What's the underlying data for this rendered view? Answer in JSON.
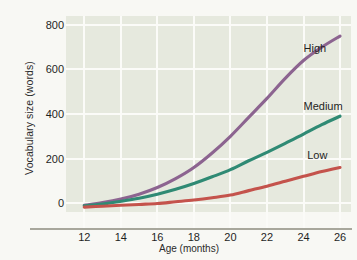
{
  "page": {
    "clipped_header_text": ""
  },
  "chart_data": {
    "type": "line",
    "title": "",
    "xlabel": "Age (months)",
    "ylabel": "Vocabulary size (words)",
    "xlim": [
      11,
      26.6
    ],
    "ylim": [
      -40,
      840
    ],
    "xticks": [
      12,
      14,
      16,
      18,
      20,
      22,
      24,
      26
    ],
    "yticks": [
      0,
      200,
      400,
      600,
      800
    ],
    "grid": true,
    "legend_position": "inline-right",
    "background_color": "#e6e9de",
    "gridline_color": "#fbfbf8",
    "x": [
      12,
      13,
      14,
      15,
      16,
      17,
      18,
      19,
      20,
      21,
      22,
      23,
      24,
      25,
      26
    ],
    "series": [
      {
        "name": "High",
        "color": "#8c6490",
        "values": [
          -10,
          2,
          18,
          40,
          70,
          110,
          160,
          225,
          300,
          385,
          470,
          560,
          640,
          700,
          750
        ]
      },
      {
        "name": "Medium",
        "color": "#2f8a74",
        "values": [
          -12,
          -4,
          8,
          22,
          40,
          62,
          88,
          118,
          150,
          190,
          228,
          268,
          310,
          352,
          390
        ]
      },
      {
        "name": "Low",
        "color": "#c4534c",
        "values": [
          -18,
          -14,
          -10,
          -6,
          -2,
          6,
          14,
          24,
          36,
          56,
          76,
          98,
          120,
          142,
          160
        ]
      }
    ],
    "annotations": [
      {
        "text": "High",
        "x": 24.0,
        "y": 690
      },
      {
        "text": "Medium",
        "x": 24.0,
        "y": 430
      },
      {
        "text": "Low",
        "x": 24.2,
        "y": 210
      }
    ]
  }
}
